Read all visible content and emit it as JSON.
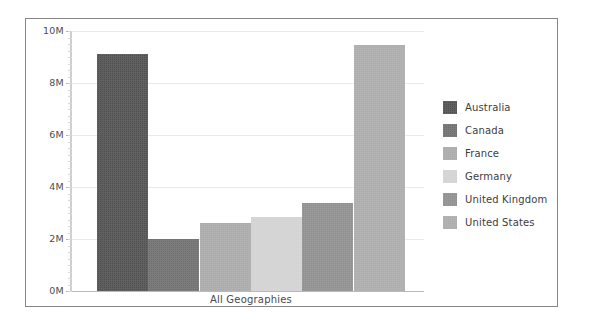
{
  "chart_data": {
    "type": "bar",
    "title": "",
    "xlabel": "All Geographies",
    "ylabel": "",
    "categories": [
      "Australia",
      "Canada",
      "France",
      "Germany",
      "United Kingdom",
      "United States"
    ],
    "values": [
      9.1,
      2.0,
      2.6,
      2.85,
      3.4,
      9.45
    ],
    "value_unit": "M",
    "ylim": [
      0,
      10
    ],
    "ytick_labels": [
      "0M",
      "2M",
      "4M",
      "6M",
      "8M",
      "10M"
    ],
    "ytick_values": [
      0,
      2,
      4,
      6,
      8,
      10
    ],
    "grid": true,
    "legend_position": "right",
    "series": [
      {
        "name": "All Geographies",
        "points": [
          {
            "category": "Australia",
            "value": 9.1,
            "color": "#4f4f4f"
          },
          {
            "category": "Canada",
            "value": 2.0,
            "color": "#6e6e6e"
          },
          {
            "category": "France",
            "value": 2.6,
            "color": "#a9a9a9"
          },
          {
            "category": "Germany",
            "value": 2.85,
            "color": "#d2d2d2"
          },
          {
            "category": "United Kingdom",
            "value": 3.4,
            "color": "#8e8e8e"
          },
          {
            "category": "United States",
            "value": 9.45,
            "color": "#ababab"
          }
        ]
      }
    ]
  },
  "axis": {
    "x_label": "All Geographies",
    "y_ticks": [
      {
        "label": "10M",
        "value": 10
      },
      {
        "label": "8M",
        "value": 8
      },
      {
        "label": "6M",
        "value": 6
      },
      {
        "label": "4M",
        "value": 4
      },
      {
        "label": "2M",
        "value": 2
      },
      {
        "label": "0M",
        "value": 0
      }
    ]
  },
  "legend": {
    "items": [
      {
        "label": "Australia",
        "color": "#4f4f4f"
      },
      {
        "label": "Canada",
        "color": "#6e6e6e"
      },
      {
        "label": "France",
        "color": "#a9a9a9"
      },
      {
        "label": "Germany",
        "color": "#d2d2d2"
      },
      {
        "label": "United Kingdom",
        "color": "#8e8e8e"
      },
      {
        "label": "United States",
        "color": "#ababab"
      }
    ]
  },
  "colors": {
    "frame_border": "#868686",
    "gridline": "#e9e9e9",
    "baseline": "#b9b9b9",
    "axis_line": "#cfcfcf",
    "text": "#3d3d3d",
    "background": "#ffffff"
  }
}
